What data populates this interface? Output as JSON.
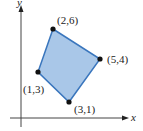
{
  "figure": {
    "type": "polygon-on-axes",
    "axes": {
      "x_label": "x",
      "y_label": "y"
    },
    "fill_color": "#a9c7e8",
    "stroke_color": "#3a76bd",
    "vertices": [
      {
        "label": "(2,6)",
        "x": 2,
        "y": 6
      },
      {
        "label": "(5,4)",
        "x": 5,
        "y": 4
      },
      {
        "label": "(3,1)",
        "x": 3,
        "y": 1
      },
      {
        "label": "(1,3)",
        "x": 1,
        "y": 3
      }
    ]
  }
}
